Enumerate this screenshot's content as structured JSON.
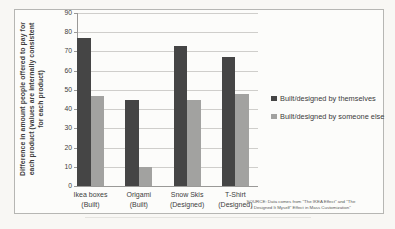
{
  "chart_data": {
    "type": "bar",
    "title": "",
    "ylabel_lines": [
      "Difference in amount people offered to pay for",
      "each product (values are internally consistent",
      "for each product)"
    ],
    "ylabel": "Difference in amount people offered to pay for each product (values are internally consistent for each product)",
    "xlabel": "",
    "categories": [
      {
        "line1": "Ikea boxes",
        "line2": "(Built)"
      },
      {
        "line1": "Origami",
        "line2": "(Built)"
      },
      {
        "line1": "Snow Skis",
        "line2": "(Designed)"
      },
      {
        "line1": "T-Shirt",
        "line2": "(Designed)"
      }
    ],
    "series": [
      {
        "name": "Built/designed by themselves",
        "color": "#454545",
        "values": [
          77,
          45,
          73,
          67
        ]
      },
      {
        "name": "Built/designed by someone else",
        "color": "#a2a2a0",
        "values": [
          47,
          10,
          45,
          48
        ]
      }
    ],
    "yticks": [
      0,
      10,
      20,
      30,
      40,
      50,
      60,
      70,
      80,
      90
    ],
    "ylim": [
      0,
      90
    ],
    "grid": true,
    "legend_position": "right",
    "source_lines": [
      "SOURCE: Data comes from \"The IKEA Effect\" and \"The",
      "I Designed It Myself\" Effect in Mass Customization\""
    ]
  }
}
